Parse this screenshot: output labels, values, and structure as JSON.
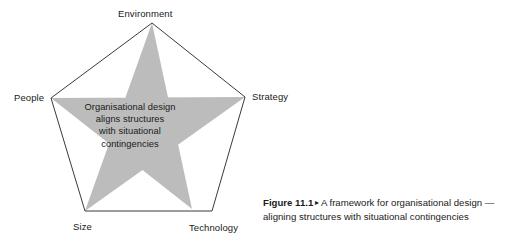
{
  "figure": {
    "shape": {
      "type": "pentagon-with-inscribed-star",
      "star_fill_color": "#bcbcbc",
      "outline_color": "#3a3a3a",
      "background_color": "#ffffff"
    },
    "vertices": [
      {
        "id": "environment",
        "label": "Environment",
        "position": "top"
      },
      {
        "id": "strategy",
        "label": "Strategy",
        "position": "right"
      },
      {
        "id": "technology",
        "label": "Technology",
        "position": "bottom-right"
      },
      {
        "id": "size",
        "label": "Size",
        "position": "bottom-left"
      },
      {
        "id": "people",
        "label": "People",
        "position": "left"
      }
    ],
    "center_text": {
      "lines": [
        "Organisational design",
        "aligns structures",
        "with situational",
        "contingencies"
      ]
    },
    "caption": {
      "number": "Figure 11.1",
      "separator": "▸",
      "text": "A framework for organisational design — aligning structures with situational contingencies"
    }
  }
}
